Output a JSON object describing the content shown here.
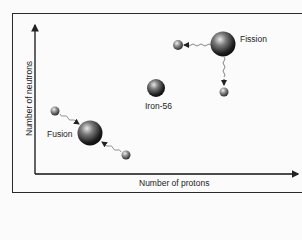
{
  "diagram": {
    "axes": {
      "x_label": "Number of protons",
      "y_label": "Number of neutrons"
    },
    "nodes": [
      {
        "id": "fission",
        "label": "Fission"
      },
      {
        "id": "iron",
        "label": "Iron-56"
      },
      {
        "id": "fusion",
        "label": "Fusion"
      }
    ]
  }
}
